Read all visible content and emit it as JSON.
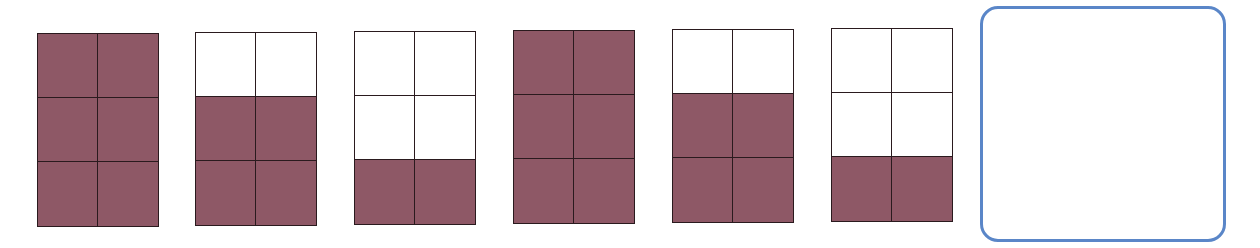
{
  "pattern": {
    "description": "Sequence of 2x3 grids with shaded rows; last position is an empty answer box",
    "fill_color": "#8e5866",
    "line_color": "#2a1a1e",
    "answer_border_color": "#5a86c8",
    "grids": [
      {
        "index": 1,
        "left": 37,
        "top": 33,
        "filled_rows": 3,
        "filled_cells": 6
      },
      {
        "index": 2,
        "left": 195,
        "top": 32,
        "filled_rows": 2,
        "filled_cells": 4
      },
      {
        "index": 3,
        "left": 354,
        "top": 31,
        "filled_rows": 1,
        "filled_cells": 2
      },
      {
        "index": 4,
        "left": 513,
        "top": 30,
        "filled_rows": 3,
        "filled_cells": 6
      },
      {
        "index": 5,
        "left": 672,
        "top": 29,
        "filled_rows": 2,
        "filled_cells": 4
      },
      {
        "index": 6,
        "left": 831,
        "top": 28,
        "filled_rows": 1,
        "filled_cells": 2
      }
    ],
    "answer_box": {
      "label": "",
      "content": ""
    }
  }
}
